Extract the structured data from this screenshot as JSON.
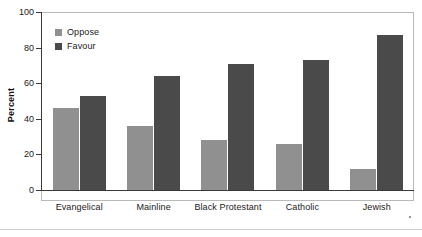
{
  "chart_data": {
    "type": "bar",
    "title": "",
    "subtitle": "",
    "xlabel": "",
    "ylabel": "Percent",
    "ylim": [
      0,
      100
    ],
    "yticks": [
      0,
      20,
      40,
      60,
      80,
      100
    ],
    "ytick_labels": [
      "0",
      "20",
      "40",
      "60",
      "80",
      "100"
    ],
    "grid": false,
    "legend_position": "top-left",
    "categories": [
      "Evangelical",
      "Mainline",
      "Black Protestant",
      "Catholic",
      "Jewish"
    ],
    "series": [
      {
        "name": "Oppose",
        "color": "#909090",
        "values": [
          46,
          36,
          28,
          26,
          12
        ]
      },
      {
        "name": "Favour",
        "color": "#4a4a4a",
        "values": [
          53,
          64,
          71,
          73,
          87
        ]
      }
    ]
  },
  "legend": {
    "items": [
      {
        "label": "Oppose",
        "color": "#909090"
      },
      {
        "label": "Favour",
        "color": "#4a4a4a"
      }
    ]
  },
  "axes": {
    "y_title": "Percent",
    "y_tick_labels": [
      "100",
      "80",
      "60",
      "40",
      "20",
      "0"
    ],
    "x_tick_labels": [
      "Evangelical",
      "Mainline",
      "Black Protestant",
      "Catholic",
      "Jewish"
    ]
  },
  "colors": {
    "oppose": "#909090",
    "favour": "#4a4a4a",
    "axis": "#3a3a3a",
    "frame": "#b9b9b9",
    "background": "#ffffff"
  }
}
